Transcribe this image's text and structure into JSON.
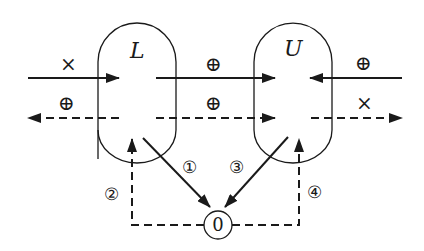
{
  "diagram": {
    "colors": {
      "stroke": "#1a1a1a",
      "background": "#ffffff"
    },
    "nodes": {
      "L": {
        "label": "L"
      },
      "U": {
        "label": "U"
      },
      "zero": {
        "label": "0"
      }
    },
    "edges": {
      "in_left_solid": {
        "symbol": "×",
        "symbol_name": "times"
      },
      "out_left_dashed": {
        "symbol": "⊕",
        "symbol_name": "oplus"
      },
      "mid_solid": {
        "symbol": "⊕",
        "symbol_name": "oplus"
      },
      "mid_dashed": {
        "symbol": "⊕",
        "symbol_name": "oplus"
      },
      "in_right_solid": {
        "symbol": "⊕",
        "symbol_name": "oplus"
      },
      "out_right_dashed": {
        "symbol": "×",
        "symbol_name": "times"
      },
      "L_to_zero": {
        "label": "①"
      },
      "zero_to_L": {
        "label": "②"
      },
      "U_to_zero": {
        "label": "③"
      },
      "zero_to_U": {
        "label": "④"
      }
    }
  }
}
